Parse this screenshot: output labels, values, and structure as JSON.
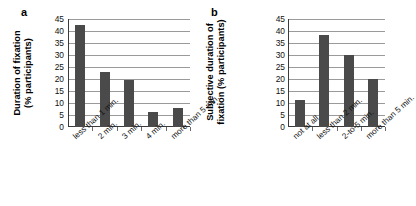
{
  "figure": {
    "background": "#ffffff",
    "bar_color": "#4a4a4a",
    "grid_color": "#9a9a9a",
    "axis_color": "#3a3a3a"
  },
  "panel_a": {
    "letter": "a",
    "ylabel_line1": "Duration of fixation",
    "ylabel_line2": "(% participants)"
  },
  "panel_b": {
    "letter": "b",
    "ylabel_line1": "Subjective duration of",
    "ylabel_line2": "fixation (% participants)"
  },
  "chart_data": [
    {
      "type": "bar",
      "panel": "a",
      "title": "",
      "xlabel": "",
      "ylabel": "Duration of fixation (% participants)",
      "categories": [
        "less than 1 min.",
        "2 min.",
        "3 min.",
        "4 min.",
        "more than 5 min."
      ],
      "values": [
        42.5,
        22.8,
        19.7,
        6.3,
        7.9
      ],
      "ylim": [
        0,
        45
      ],
      "yticks": [
        0,
        5,
        10,
        15,
        20,
        25,
        30,
        35,
        40,
        45
      ],
      "grid": true,
      "legend": "none"
    },
    {
      "type": "bar",
      "panel": "b",
      "title": "",
      "xlabel": "",
      "ylabel": "Subjective duration of fixation (% participants)",
      "categories": [
        "not at all",
        "less than 2 min.",
        "2-to-5 min.",
        "more than 5 min."
      ],
      "values": [
        11.2,
        38.3,
        30.0,
        19.8
      ],
      "ylim": [
        0,
        45
      ],
      "yticks": [
        0,
        5,
        10,
        15,
        20,
        25,
        30,
        35,
        40,
        45
      ],
      "grid": true,
      "legend": "none"
    }
  ]
}
